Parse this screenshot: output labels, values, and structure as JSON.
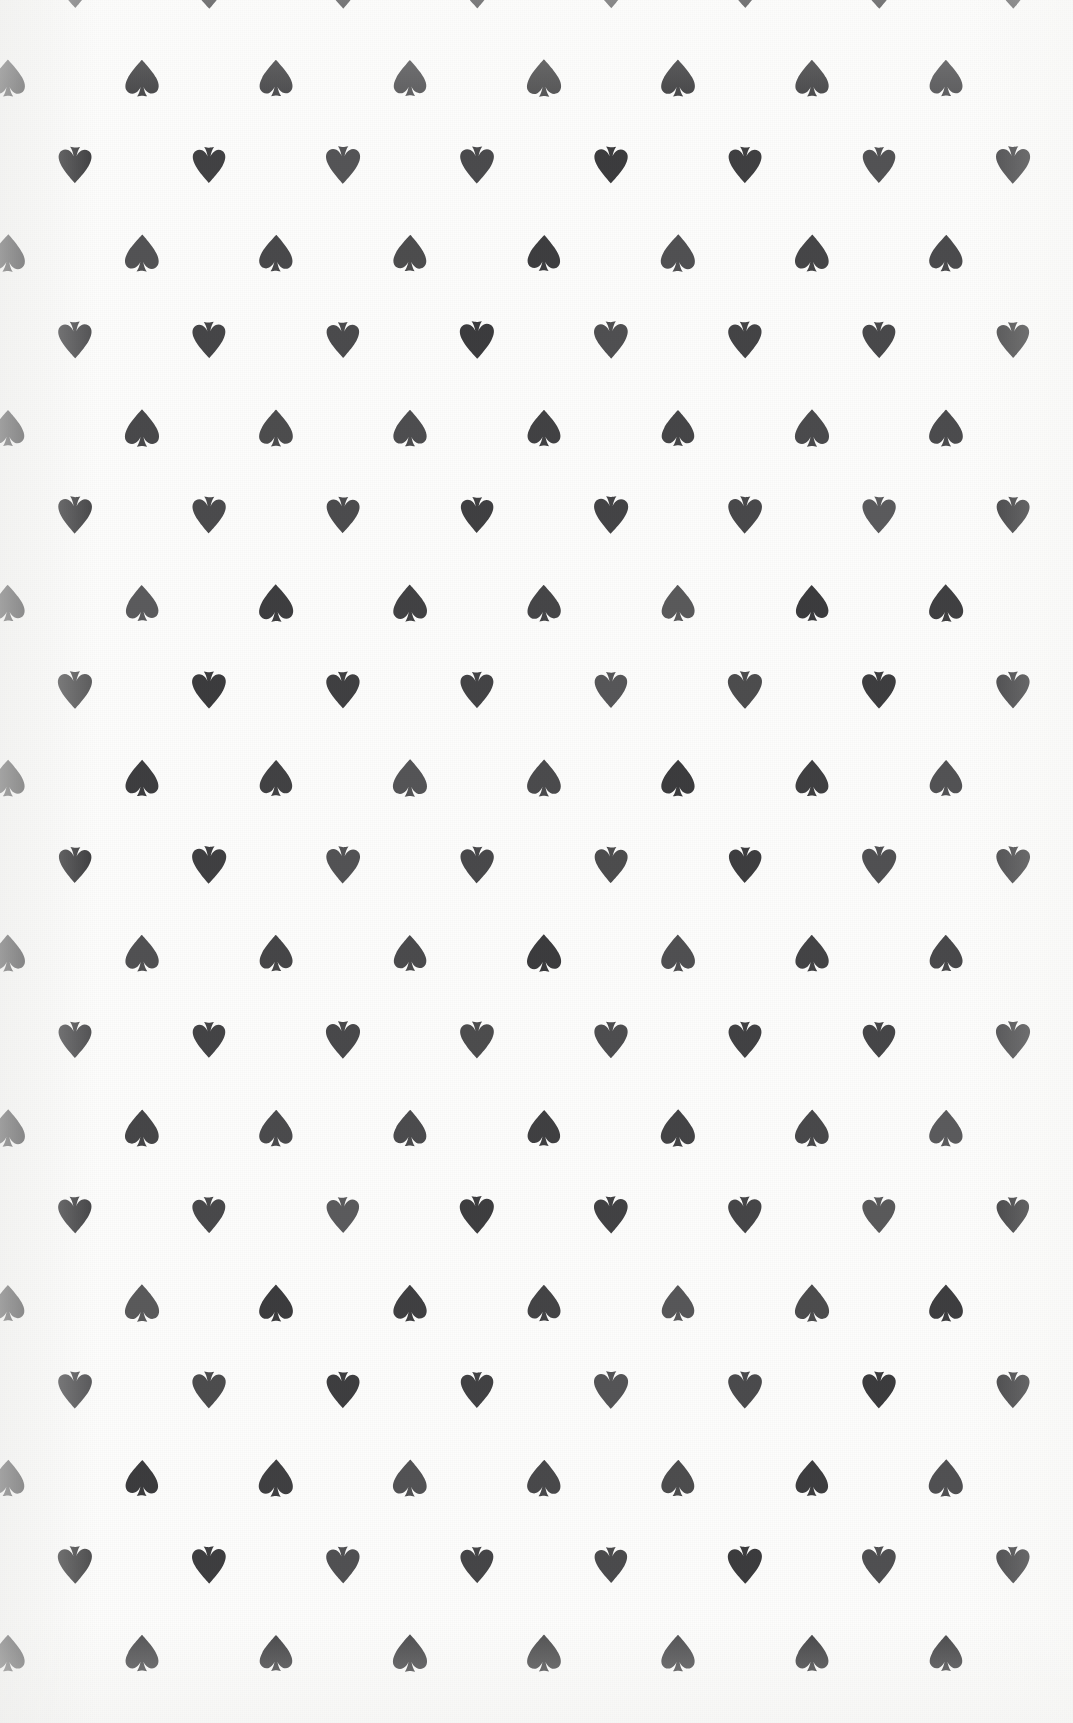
{
  "artwork": {
    "title": "Playing Card Back Pattern",
    "subject": "spade pip repeat pattern",
    "medium": "printed paper, halftone ink"
  },
  "canvas": {
    "width": 1073,
    "height": 1723,
    "background_color": "#fdfdfc",
    "paper_tone": "off-white"
  },
  "pip": {
    "icon_name": "spade-icon",
    "ink_color": "#3a3a3c",
    "ink_color_light": "#4a4a4c",
    "width": 36,
    "height": 42,
    "orientations": [
      "upright",
      "inverted"
    ]
  },
  "pattern": {
    "type": "offset-grid",
    "column_spacing": 134,
    "row_spacing": 87.5,
    "row_offset": 67,
    "column_origin_upright": 8,
    "column_origin_inverted": 75,
    "columns_per_row": 8,
    "row_count": 20,
    "row_sequence": [
      "inverted",
      "upright"
    ],
    "first_row_y": -10,
    "description": "Alternating rows of upright and inverted spade pips on a half-step offset lattice"
  },
  "chart_data": {
    "type": "scatter",
    "xlabel": "",
    "ylabel": "",
    "xlim": [
      0,
      1073
    ],
    "ylim": [
      0,
      1723
    ],
    "grid": false,
    "legend": "none",
    "series": [
      {
        "name": "inverted-spade",
        "marker": "spade-rotated-180",
        "color": "#3a3a3c",
        "x_positions": [
          75,
          209,
          343,
          477,
          610,
          744,
          878,
          1012
        ],
        "y_positions": [
          -10,
          77.5,
          165,
          252.5,
          340,
          427.5,
          515,
          602.5,
          690,
          777.5,
          865,
          952.5,
          1040,
          1127.5,
          1215,
          1302.5,
          1390,
          1477.5,
          1565,
          1652.5
        ]
      },
      {
        "name": "upright-spade",
        "marker": "spade",
        "color": "#3a3a3c",
        "x_positions": [
          8,
          142,
          276,
          410,
          543,
          677,
          811,
          945
        ],
        "y_positions": [
          -10,
          77.5,
          165,
          252.5,
          340,
          427.5,
          515,
          602.5,
          690,
          777.5,
          865,
          952.5,
          1040,
          1127.5,
          1215,
          1302.5,
          1390,
          1477.5,
          1565,
          1652.5
        ]
      }
    ]
  }
}
